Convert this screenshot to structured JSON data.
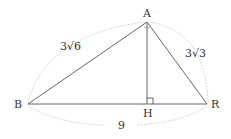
{
  "figure": {
    "type": "right-triangle-with-altitude",
    "vertices": {
      "A": "A",
      "B": "B",
      "R": "R",
      "H": "H"
    },
    "side_labels": {
      "AB": "3√6",
      "AR": "3√3",
      "BR": "9"
    },
    "right_angles": [
      "BAR",
      "AHR"
    ],
    "segments": [
      "AB",
      "AR",
      "BR",
      "AH"
    ]
  }
}
